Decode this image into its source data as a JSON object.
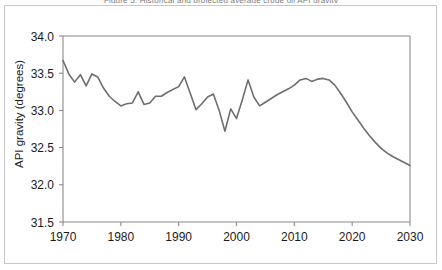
{
  "figure": {
    "title": "Figure 5. Historical and projected average crude oil API gravity",
    "background_color": "#ffffff",
    "frame_color": "#c9c9c9"
  },
  "chart_data": {
    "type": "line",
    "title": "",
    "xlabel": "",
    "ylabel": "API gravity (degrees)",
    "xlim": [
      1970,
      2030
    ],
    "ylim": [
      31.5,
      34.0
    ],
    "xticks": [
      1970,
      1980,
      1990,
      2000,
      2010,
      2020,
      2030
    ],
    "xtick_labels": [
      "1970",
      "1980",
      "1990",
      "2000",
      "2010",
      "2020",
      "2030"
    ],
    "yticks": [
      31.5,
      32.0,
      32.5,
      33.0,
      33.5,
      34.0
    ],
    "ytick_labels": [
      "31.5",
      "32.0",
      "32.5",
      "33.0",
      "33.5",
      "34.0"
    ],
    "grid": false,
    "legend": false,
    "legend_position": "none",
    "line_color": "#6e6e6e",
    "line_width": 1.6,
    "series": [
      {
        "name": "API gravity",
        "x": [
          1970,
          1971,
          1972,
          1973,
          1974,
          1975,
          1976,
          1977,
          1978,
          1979,
          1980,
          1981,
          1982,
          1983,
          1984,
          1985,
          1986,
          1987,
          1988,
          1989,
          1990,
          1991,
          1992,
          1993,
          1994,
          1995,
          1996,
          1997,
          1998,
          1999,
          2000,
          2001,
          2002,
          2003,
          2004,
          2005,
          2006,
          2007,
          2008,
          2009,
          2010,
          2011,
          2012,
          2013,
          2014,
          2015,
          2016,
          2017,
          2018,
          2019,
          2020,
          2021,
          2022,
          2023,
          2024,
          2025,
          2026,
          2027,
          2028,
          2029,
          2030
        ],
        "y": [
          33.67,
          33.49,
          33.38,
          33.48,
          33.33,
          33.49,
          33.45,
          33.3,
          33.19,
          33.12,
          33.06,
          33.09,
          33.1,
          33.25,
          33.08,
          33.1,
          33.19,
          33.19,
          33.24,
          33.28,
          33.32,
          33.45,
          33.23,
          33.01,
          33.09,
          33.18,
          33.22,
          33.0,
          32.72,
          33.02,
          32.89,
          33.14,
          33.41,
          33.18,
          33.06,
          33.11,
          33.16,
          33.21,
          33.25,
          33.29,
          33.34,
          33.41,
          33.43,
          33.39,
          33.42,
          33.43,
          33.41,
          33.34,
          33.23,
          33.11,
          32.98,
          32.87,
          32.76,
          32.66,
          32.57,
          32.49,
          32.43,
          32.38,
          32.34,
          32.3,
          32.26
        ]
      }
    ]
  }
}
